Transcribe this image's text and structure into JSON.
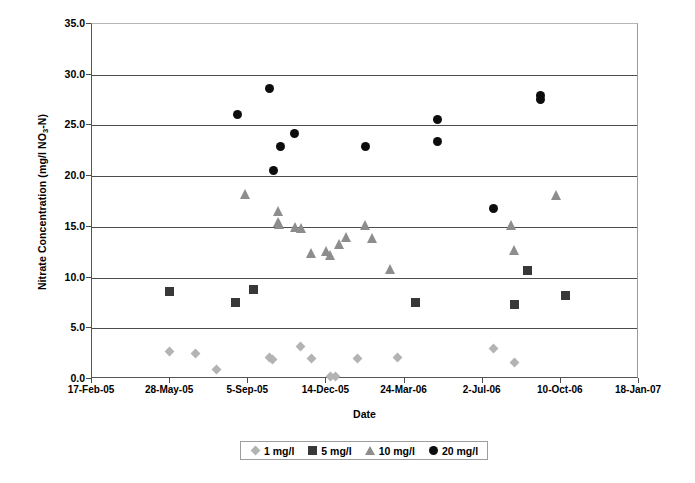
{
  "chart_data": {
    "type": "scatter",
    "title": "",
    "xlabel": "Date",
    "ylabel": "Nitrate Concentration (mg/l NO3-N)",
    "ylabel_parts": {
      "pre": "Nitrate Concentration (mg/l NO",
      "sub": "3",
      "post": "-N)"
    },
    "grid": true,
    "legend_position": "bottom",
    "ylim": [
      0.0,
      35.0
    ],
    "ytick_step": 5.0,
    "yticks": [
      "0.0",
      "5.0",
      "10.0",
      "15.0",
      "20.0",
      "25.0",
      "30.0",
      "35.0"
    ],
    "ytick_values": [
      0.0,
      5.0,
      10.0,
      15.0,
      20.0,
      25.0,
      30.0,
      35.0
    ],
    "xticks": [
      "17-Feb-05",
      "28-May-05",
      "5-Sep-05",
      "14-Dec-05",
      "24-Mar-06",
      "2-Jul-06",
      "10-Oct-06",
      "18-Jan-07"
    ],
    "xtick_fractions": [
      0,
      0.142857,
      0.285714,
      0.428571,
      0.571429,
      0.714286,
      0.857143,
      1.0
    ],
    "series": [
      {
        "name": "1 mg/l",
        "marker": "diamond",
        "color": "#b3b3b3",
        "points": [
          {
            "xf": 0.1408,
            "y": 2.7
          },
          {
            "xf": 0.1901,
            "y": 2.5
          },
          {
            "xf": 0.2285,
            "y": 0.9
          },
          {
            "xf": 0.3236,
            "y": 2.1
          },
          {
            "xf": 0.3291,
            "y": 1.9
          },
          {
            "xf": 0.3803,
            "y": 3.2
          },
          {
            "xf": 0.4004,
            "y": 2.0
          },
          {
            "xf": 0.4369,
            "y": 0.2
          },
          {
            "xf": 0.446,
            "y": 0.2
          },
          {
            "xf": 0.4845,
            "y": 2.0
          },
          {
            "xf": 0.5594,
            "y": 2.1
          },
          {
            "xf": 0.7349,
            "y": 3.0
          },
          {
            "xf": 0.7715,
            "y": 1.6
          }
        ]
      },
      {
        "name": "5 mg/l",
        "marker": "square",
        "color": "#383838",
        "points": [
          {
            "xf": 0.1408,
            "y": 8.6
          },
          {
            "xf": 0.2632,
            "y": 7.5
          },
          {
            "xf": 0.2961,
            "y": 8.8
          },
          {
            "xf": 0.5923,
            "y": 7.5
          },
          {
            "xf": 0.7715,
            "y": 7.3
          },
          {
            "xf": 0.797,
            "y": 10.7
          },
          {
            "xf": 0.8665,
            "y": 8.2
          }
        ]
      },
      {
        "name": "10 mg/l",
        "marker": "triangle",
        "color": "#8d8d8d",
        "points": [
          {
            "xf": 0.2815,
            "y": 18.2
          },
          {
            "xf": 0.3401,
            "y": 16.6
          },
          {
            "xf": 0.3401,
            "y": 15.5
          },
          {
            "xf": 0.3419,
            "y": 15.3
          },
          {
            "xf": 0.3729,
            "y": 15.0
          },
          {
            "xf": 0.3821,
            "y": 14.9
          },
          {
            "xf": 0.4004,
            "y": 12.4
          },
          {
            "xf": 0.4278,
            "y": 12.6
          },
          {
            "xf": 0.4369,
            "y": 12.2
          },
          {
            "xf": 0.4516,
            "y": 13.3
          },
          {
            "xf": 0.4644,
            "y": 14.0
          },
          {
            "xf": 0.5009,
            "y": 15.2
          },
          {
            "xf": 0.5137,
            "y": 13.9
          },
          {
            "xf": 0.5466,
            "y": 10.8
          },
          {
            "xf": 0.766,
            "y": 15.2
          },
          {
            "xf": 0.7715,
            "y": 12.7
          },
          {
            "xf": 0.8483,
            "y": 18.1
          }
        ]
      },
      {
        "name": "20 mg/l",
        "marker": "circle",
        "color": "#0d0d0d",
        "points": [
          {
            "xf": 0.2669,
            "y": 26.1
          },
          {
            "xf": 0.3236,
            "y": 28.6
          },
          {
            "xf": 0.3309,
            "y": 20.6
          },
          {
            "xf": 0.3455,
            "y": 22.9
          },
          {
            "xf": 0.3693,
            "y": 24.2
          },
          {
            "xf": 0.5009,
            "y": 22.9
          },
          {
            "xf": 0.6325,
            "y": 25.6
          },
          {
            "xf": 0.6325,
            "y": 23.4
          },
          {
            "xf": 0.7349,
            "y": 16.8
          },
          {
            "xf": 0.8208,
            "y": 28.0
          },
          {
            "xf": 0.8208,
            "y": 27.6
          }
        ]
      }
    ]
  },
  "axes": {
    "x_title": "Date",
    "y_title_pre": "Nitrate Concentration (mg/l NO",
    "y_title_sub": "3",
    "y_title_post": "-N)"
  },
  "legend": {
    "entries": [
      {
        "label": "1 mg/l",
        "marker": "diamond",
        "color": "#b3b3b3"
      },
      {
        "label": "5 mg/l",
        "marker": "square",
        "color": "#383838"
      },
      {
        "label": "10 mg/l",
        "marker": "triangle",
        "color": "#8d8d8d"
      },
      {
        "label": "20 mg/l",
        "marker": "circle",
        "color": "#0d0d0d"
      }
    ]
  }
}
